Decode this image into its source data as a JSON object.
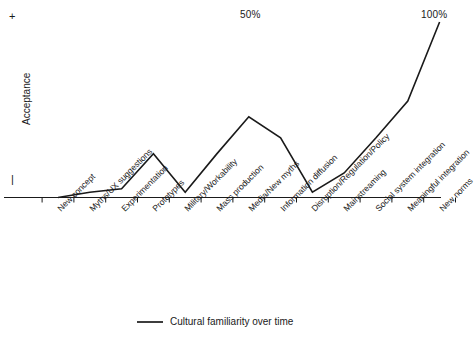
{
  "chart_data": {
    "type": "line",
    "title": "",
    "xlabel": "",
    "ylabel": "Acceptance",
    "categories": [
      "New concept",
      "Myths/UX suggestions",
      "Experimentation",
      "Prototypes",
      "Military/Workability",
      "Mass production",
      "Media/New myths",
      "Information diffusion",
      "Disruption/Regulation/Policy",
      "Mainstreaming",
      "Social system integration",
      "Meaningful integration",
      "New norms"
    ],
    "series": [
      {
        "name": "Cultural familiarity over time",
        "values": [
          0,
          3,
          5,
          25,
          3,
          25,
          46,
          34,
          3,
          14,
          34,
          55,
          100
        ]
      }
    ],
    "ylim": [
      0,
      100
    ],
    "grid": false,
    "legend_position": "bottom",
    "annotations": [
      {
        "name": "midpoint-percent",
        "text": "50%",
        "x_category": "Media/New myths"
      },
      {
        "name": "endpoint-percent",
        "text": "100%",
        "x_category": "New norms"
      }
    ],
    "y_axis_markers": {
      "high": "+",
      "low": "|"
    },
    "line_color": "#1a1a1a"
  },
  "axis": {
    "y_label": "Acceptance",
    "y_high_symbol": "+",
    "y_low_symbol": "|"
  },
  "annotations": {
    "mid_percent": "50%",
    "end_percent": "100%"
  },
  "legend": {
    "series_label": "Cultural familiarity over time"
  },
  "categories": [
    "New concept",
    "Myths/UX suggestions",
    "Experimentation",
    "Prototypes",
    "Military/Workability",
    "Mass production",
    "Media/New myths",
    "Information diffusion",
    "Disruption/Regulation/Policy",
    "Mainstreaming",
    "Social system integration",
    "Meaningful integration",
    "New norms"
  ]
}
